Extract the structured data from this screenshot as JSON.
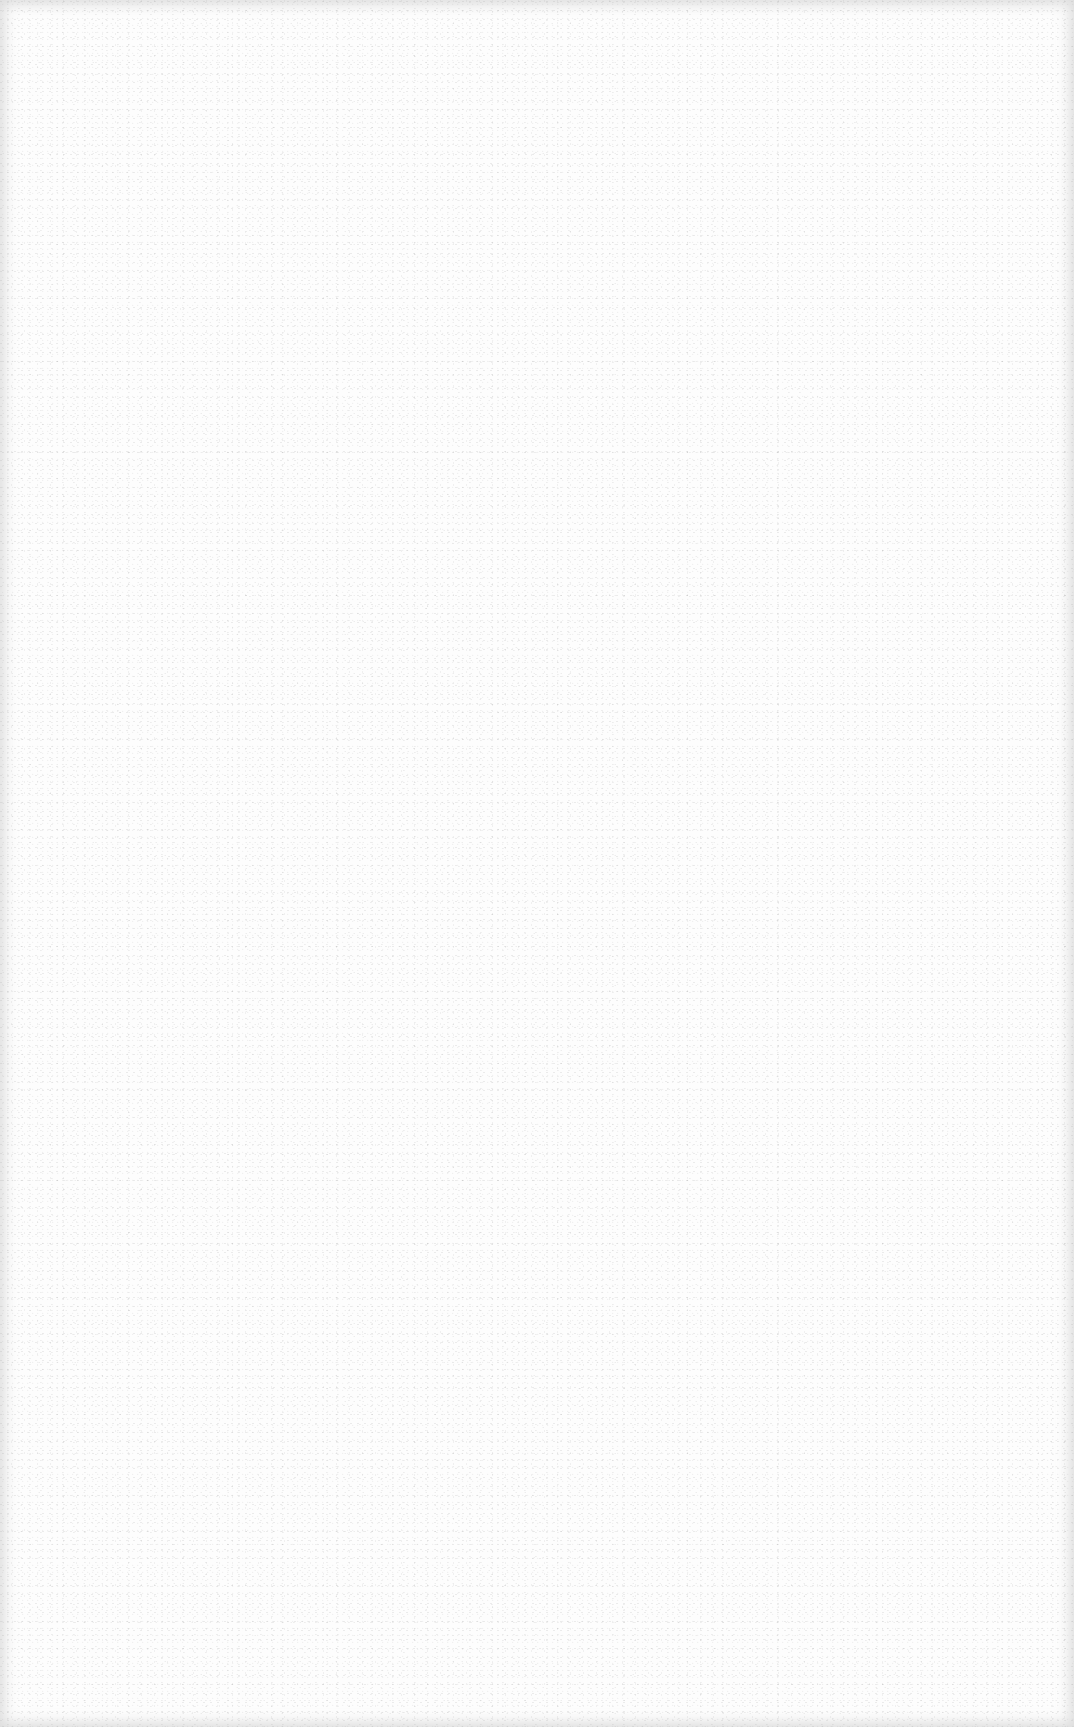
{
  "page": {
    "background_color": "#fdfdfd",
    "edge_shade_color": "#a0a0a0",
    "content": []
  }
}
